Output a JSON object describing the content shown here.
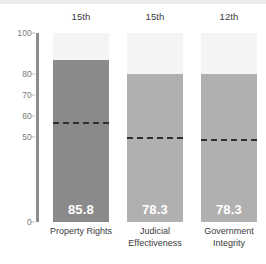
{
  "chart_data": {
    "type": "bar",
    "title": "",
    "xlabel": "",
    "ylabel": "",
    "ylim": [
      0,
      100
    ],
    "grid": false,
    "legend": "none",
    "categories": [
      "Property Rights",
      "Judicial Effectiveness",
      "Government Integrity"
    ],
    "values": [
      85.8,
      78.3,
      78.3
    ],
    "value_labels": [
      "85.8",
      "78.3",
      "78.3"
    ],
    "ranks": [
      "15th",
      "15th",
      "12th"
    ],
    "reference_lines": [
      52.0,
      44.0,
      43.0
    ],
    "ytick_labels": [
      "100",
      "80",
      "70",
      "60",
      "50",
      "0"
    ],
    "ytick_values": [
      100,
      80,
      70,
      60,
      50,
      0
    ],
    "series": [
      {
        "name": "Score",
        "values": [
          85.8,
          78.3,
          78.3
        ]
      }
    ],
    "bar_colors": [
      "#8a8a8a",
      "#b0b0b0",
      "#b0b0b0"
    ],
    "track_color": "#f4f4f4",
    "refline_color": "#2e2e2e",
    "axis_color": "#8d8d8d"
  }
}
